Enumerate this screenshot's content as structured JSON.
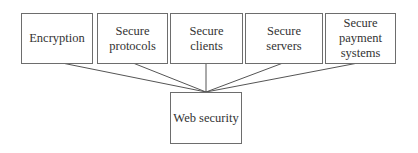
{
  "diagram": {
    "root": {
      "label": "Web security"
    },
    "children": [
      {
        "label": "Encryption"
      },
      {
        "label": "Secure protocols"
      },
      {
        "label": "Secure clients"
      },
      {
        "label": "Secure servers"
      },
      {
        "label": "Secure payment systems"
      }
    ],
    "colors": {
      "border": "#6d6d6d",
      "line": "#555555",
      "text": "#333333"
    }
  }
}
